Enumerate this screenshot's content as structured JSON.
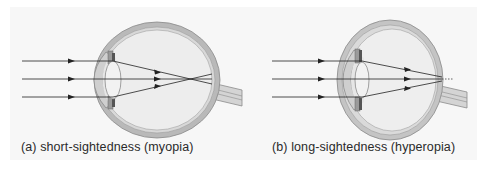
{
  "figures": [
    {
      "id": "a",
      "caption": "(a) short-sightedness (myopia)",
      "condition": "myopia",
      "focus": "in front of retina"
    },
    {
      "id": "b",
      "caption": "(b) long-sightedness (hyperopia)",
      "condition": "hyperopia",
      "focus": "behind retina"
    }
  ],
  "colors": {
    "sclera": "#b8b8b8",
    "choroid": "#d6d6d6",
    "interior": "#ececec",
    "ray": "#222222",
    "background": "#f7f7f7"
  }
}
